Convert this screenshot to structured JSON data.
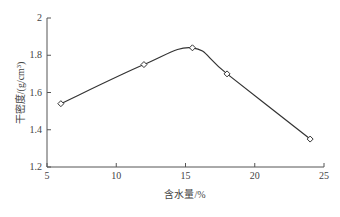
{
  "chart_data": {
    "type": "line",
    "title": "",
    "xlabel": "含水量/%",
    "ylabel": "干密度/(g/cm³)",
    "x": [
      6,
      12,
      15.5,
      18,
      24
    ],
    "series": [
      {
        "name": "干密度",
        "values": [
          1.54,
          1.75,
          1.84,
          1.7,
          1.35
        ]
      }
    ],
    "xlim": [
      5,
      25
    ],
    "ylim": [
      1.2,
      2.0
    ],
    "xticks": [
      "5",
      "10",
      "15",
      "20",
      "25"
    ],
    "yticks": [
      "1.2",
      "1.4",
      "1.6",
      "1.8",
      "2"
    ],
    "grid": false,
    "legend": null,
    "marker": "hollow-diamond",
    "line_color": "#333333"
  }
}
